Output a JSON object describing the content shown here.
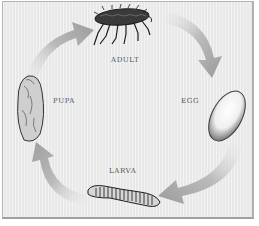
{
  "diagram": {
    "type": "life-cycle",
    "direction": "clockwise",
    "stages": [
      {
        "id": "adult",
        "label": "ADULT",
        "icon": "flea-adult-icon"
      },
      {
        "id": "egg",
        "label": "EGG",
        "icon": "egg-icon"
      },
      {
        "id": "larva",
        "label": "LARVA",
        "icon": "larva-icon"
      },
      {
        "id": "pupa",
        "label": "PUPA",
        "icon": "pupa-icon"
      }
    ],
    "arrows": [
      {
        "from": "adult",
        "to": "egg"
      },
      {
        "from": "egg",
        "to": "larva"
      },
      {
        "from": "larva",
        "to": "pupa"
      },
      {
        "from": "pupa",
        "to": "adult"
      }
    ],
    "colors": {
      "background": "#ececec",
      "border": "#b4b4b4",
      "arrow": "#a8a8a8",
      "label": "#555555",
      "ink": "#2a2a2a"
    }
  }
}
